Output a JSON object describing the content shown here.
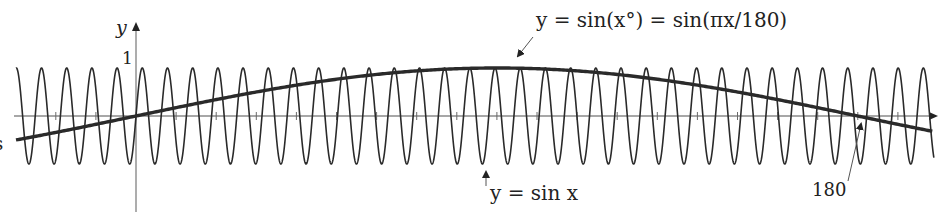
{
  "chart_data": {
    "type": "line",
    "title": "",
    "xlabel": "x",
    "ylabel": "y",
    "xlim": [
      -30,
      199
    ],
    "ylim": [
      -1,
      1
    ],
    "y_tick_labels": [
      "1"
    ],
    "x_tick_spacing": 10,
    "grid": false,
    "legend": "none (curves labeled by annotation)",
    "series": [
      {
        "name": "y = sin x",
        "formula": "sin(x)",
        "style": "thin dark line",
        "amplitude": 1,
        "period": 6.2832
      },
      {
        "name": "y = sin(x°) = sin(πx/180)",
        "formula": "sin(pi*x/180)",
        "style": "thick dark line",
        "amplitude": 1,
        "period": 360,
        "zero_crossings": [
          0,
          180
        ],
        "peak": {
          "x": 90,
          "y": 1
        }
      }
    ],
    "annotations": [
      {
        "text": "y = sin(x°) = sin(πx/180)",
        "points_to": "thick curve near peak"
      },
      {
        "text": "y = sin x",
        "points_to": "trough of thin curve"
      },
      {
        "text": "180",
        "points_to": "x-axis zero crossing of thick curve at x = 180"
      }
    ]
  },
  "labels": {
    "y_axis": "y",
    "y_one": "1",
    "x_axis_partial": "x",
    "left_cut": "s",
    "annot_deg": "y = sin(x°) = sin(πx/180)",
    "annot_rad": "y = sin x",
    "annot_180": "180"
  },
  "colors": {
    "curve": "#2a2a2a",
    "axis": "#8a8a8a",
    "text": "#222222"
  }
}
